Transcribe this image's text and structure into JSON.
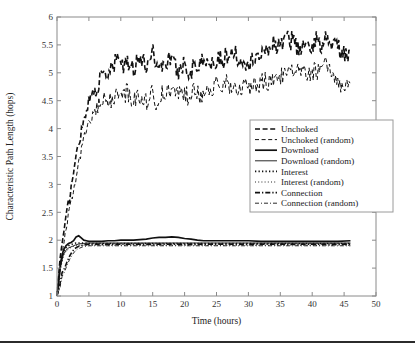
{
  "figure": {
    "background": "#ffffff",
    "ink": "#111111",
    "axis_color": "#8a8a8a",
    "footer_rule_y": 341
  },
  "chart_data": {
    "type": "line",
    "title": "",
    "xlabel": "Time (hours)",
    "ylabel": "Characteristic Path Length (hops)",
    "xlim": [
      0,
      50
    ],
    "ylim": [
      1,
      6
    ],
    "xticks": [
      0,
      5,
      10,
      15,
      20,
      25,
      30,
      35,
      40,
      45,
      50
    ],
    "xticklabels": [
      "0",
      "5",
      "10",
      "15",
      "20",
      "25",
      "30",
      "35",
      "40",
      "45",
      "50"
    ],
    "yticks": [
      1,
      1.5,
      2,
      2.5,
      3,
      3.5,
      4,
      4.5,
      5,
      5.5,
      6
    ],
    "yticklabels": [
      "1",
      "1.5",
      "2",
      "2.5",
      "3",
      "3.5",
      "4",
      "4.5",
      "5",
      "5.5",
      "6"
    ],
    "grid": false,
    "legend_position": "center-right",
    "series": [
      {
        "name": "Unchoked",
        "style": "dashed",
        "width": 1.6,
        "x": [
          0,
          0.5,
          1,
          1.5,
          2,
          2.5,
          3,
          3.5,
          4,
          4.5,
          5,
          5.5,
          6,
          6.5,
          7,
          7.5,
          8,
          8.5,
          9,
          9.5,
          10,
          10.5,
          11,
          11.5,
          12,
          12.5,
          13,
          13.5,
          14,
          14.5,
          15,
          15.5,
          16,
          16.5,
          17,
          17.5,
          18,
          18.5,
          19,
          19.5,
          20,
          20.5,
          21,
          21.5,
          22,
          22.5,
          23,
          23.5,
          24,
          24.5,
          25,
          25.5,
          26,
          26.5,
          27,
          27.5,
          28,
          28.5,
          29,
          29.5,
          30,
          30.5,
          31,
          31.5,
          32,
          32.5,
          33,
          33.5,
          34,
          34.5,
          35,
          35.5,
          36,
          36.5,
          37,
          37.5,
          38,
          38.5,
          39,
          39.5,
          40,
          40.5,
          41,
          41.5,
          42,
          42.5,
          43,
          43.5,
          44,
          44.5,
          45,
          45.5,
          46
        ],
        "y": [
          1.0,
          1.7,
          2.1,
          2.45,
          2.8,
          3.15,
          3.5,
          3.8,
          4.05,
          4.3,
          4.5,
          4.62,
          4.72,
          4.8,
          4.9,
          5.0,
          4.95,
          5.05,
          5.12,
          5.35,
          5.18,
          5.08,
          5.16,
          5.24,
          5.05,
          5.22,
          5.3,
          5.18,
          5.12,
          5.28,
          5.45,
          5.15,
          5.2,
          5.08,
          5.15,
          5.3,
          5.22,
          5.12,
          5.02,
          5.1,
          5.2,
          5.08,
          5.0,
          5.18,
          5.1,
          5.22,
          5.15,
          5.28,
          5.18,
          5.12,
          5.25,
          5.32,
          5.18,
          5.3,
          5.38,
          5.28,
          5.42,
          5.2,
          5.3,
          5.22,
          5.15,
          5.28,
          5.2,
          5.35,
          5.28,
          5.4,
          5.5,
          5.42,
          5.55,
          5.48,
          5.6,
          5.52,
          5.68,
          5.55,
          5.62,
          5.48,
          5.4,
          5.52,
          5.45,
          5.38,
          5.5,
          5.62,
          5.55,
          5.48,
          5.6,
          5.7,
          5.58,
          5.45,
          5.5,
          5.4,
          5.35,
          5.28,
          5.35
        ]
      },
      {
        "name": "Unchoked (random)",
        "style": "dashed",
        "width": 1.0,
        "x": [
          0,
          0.5,
          1,
          1.5,
          2,
          2.5,
          3,
          3.5,
          4,
          4.5,
          5,
          5.5,
          6,
          6.5,
          7,
          7.5,
          8,
          8.5,
          9,
          9.5,
          10,
          10.5,
          11,
          11.5,
          12,
          12.5,
          13,
          13.5,
          14,
          14.5,
          15,
          15.5,
          16,
          16.5,
          17,
          17.5,
          18,
          18.5,
          19,
          19.5,
          20,
          20.5,
          21,
          21.5,
          22,
          22.5,
          23,
          23.5,
          24,
          24.5,
          25,
          25.5,
          26,
          26.5,
          27,
          27.5,
          28,
          28.5,
          29,
          29.5,
          30,
          30.5,
          31,
          31.5,
          32,
          32.5,
          33,
          33.5,
          34,
          34.5,
          35,
          35.5,
          36,
          36.5,
          37,
          37.5,
          38,
          38.5,
          39,
          39.5,
          40,
          40.5,
          41,
          41.5,
          42,
          42.5,
          43,
          43.5,
          44,
          44.5,
          45,
          45.5,
          46
        ],
        "y": [
          1.0,
          1.5,
          1.9,
          2.2,
          2.55,
          2.85,
          3.15,
          3.45,
          3.7,
          3.95,
          4.1,
          4.22,
          4.3,
          4.38,
          4.45,
          4.5,
          4.46,
          4.52,
          4.58,
          4.62,
          4.55,
          4.6,
          4.66,
          4.58,
          4.5,
          4.55,
          4.62,
          4.54,
          4.48,
          4.56,
          4.62,
          4.5,
          4.55,
          4.62,
          4.58,
          4.66,
          4.6,
          4.68,
          4.62,
          4.7,
          4.64,
          4.58,
          4.66,
          4.72,
          4.64,
          4.6,
          4.68,
          4.74,
          4.66,
          4.72,
          4.78,
          4.7,
          4.76,
          4.82,
          4.74,
          4.8,
          4.72,
          4.78,
          4.7,
          4.76,
          4.68,
          4.75,
          4.82,
          4.74,
          4.8,
          4.88,
          4.8,
          4.86,
          4.94,
          4.86,
          4.92,
          5.0,
          4.92,
          4.98,
          5.06,
          4.98,
          5.04,
          4.96,
          5.02,
          4.94,
          5.0,
          5.08,
          5.0,
          5.06,
          5.14,
          5.06,
          5.0,
          4.92,
          4.85,
          4.78,
          4.82,
          4.76,
          4.8
        ]
      },
      {
        "name": "Download",
        "style": "solid",
        "width": 1.7,
        "x": [
          0,
          0.3,
          0.6,
          1,
          1.4,
          1.8,
          2.2,
          2.6,
          3,
          3.4,
          3.8,
          4.2,
          4.6,
          5,
          6,
          7,
          8,
          9,
          10,
          11,
          12,
          13,
          14,
          15,
          16,
          17,
          18,
          19,
          20,
          21,
          22,
          23,
          24,
          25,
          26,
          27,
          28,
          30,
          32,
          34,
          36,
          38,
          40,
          42,
          44,
          46
        ],
        "y": [
          1.0,
          1.35,
          1.62,
          1.82,
          1.9,
          1.94,
          1.96,
          1.99,
          2.06,
          2.08,
          2.04,
          2.0,
          1.99,
          1.98,
          1.98,
          1.98,
          1.99,
          1.99,
          2.0,
          2.0,
          2.0,
          2.01,
          2.02,
          2.04,
          2.05,
          2.05,
          2.06,
          2.05,
          2.03,
          2.02,
          2.0,
          1.99,
          1.99,
          1.99,
          1.99,
          1.99,
          1.99,
          1.99,
          1.98,
          1.98,
          1.98,
          1.98,
          1.98,
          1.98,
          1.98,
          1.99
        ]
      },
      {
        "name": "Download (random)",
        "style": "solid",
        "width": 0.9,
        "x": [
          0,
          0.3,
          0.6,
          1,
          1.4,
          1.8,
          2.2,
          2.6,
          3,
          3.4,
          3.8,
          4.2,
          4.6,
          5,
          6,
          7,
          8,
          9,
          10,
          12,
          14,
          16,
          18,
          20,
          22,
          24,
          26,
          28,
          30,
          32,
          34,
          36,
          38,
          40,
          42,
          44,
          46
        ],
        "y": [
          1.0,
          1.28,
          1.55,
          1.74,
          1.82,
          1.86,
          1.88,
          1.9,
          1.92,
          1.93,
          1.94,
          1.94,
          1.95,
          1.95,
          1.95,
          1.95,
          1.95,
          1.95,
          1.95,
          1.95,
          1.95,
          1.95,
          1.95,
          1.95,
          1.95,
          1.95,
          1.95,
          1.95,
          1.95,
          1.95,
          1.95,
          1.95,
          1.95,
          1.95,
          1.95,
          1.95,
          1.95
        ]
      },
      {
        "name": "Interest",
        "style": "dotted",
        "width": 1.6,
        "x": [
          0,
          0.3,
          0.6,
          1,
          1.4,
          1.8,
          2.2,
          2.6,
          3,
          3.5,
          4,
          5,
          6,
          8,
          10,
          12,
          14,
          16,
          18,
          20,
          22,
          24,
          26,
          28,
          30,
          32,
          34,
          36,
          38,
          40,
          42,
          44,
          46
        ],
        "y": [
          1.0,
          1.3,
          1.58,
          1.78,
          1.86,
          1.9,
          1.92,
          1.94,
          1.95,
          1.95,
          1.95,
          1.94,
          1.94,
          1.94,
          1.94,
          1.94,
          1.94,
          1.94,
          1.94,
          1.94,
          1.94,
          1.94,
          1.94,
          1.94,
          1.94,
          1.94,
          1.94,
          1.94,
          1.94,
          1.94,
          1.94,
          1.94,
          1.94
        ]
      },
      {
        "name": "Interest (random)",
        "style": "dotted",
        "width": 0.9,
        "x": [
          0,
          0.3,
          0.6,
          1,
          1.4,
          1.8,
          2.2,
          2.6,
          3,
          3.5,
          4,
          5,
          6,
          8,
          10,
          12,
          14,
          16,
          18,
          20,
          22,
          24,
          26,
          28,
          30,
          32,
          34,
          36,
          38,
          40,
          42,
          44,
          46
        ],
        "y": [
          1.0,
          1.25,
          1.52,
          1.72,
          1.8,
          1.84,
          1.87,
          1.89,
          1.9,
          1.91,
          1.91,
          1.91,
          1.91,
          1.91,
          1.91,
          1.91,
          1.91,
          1.91,
          1.91,
          1.91,
          1.91,
          1.91,
          1.91,
          1.91,
          1.91,
          1.91,
          1.91,
          1.91,
          1.91,
          1.91,
          1.91,
          1.91,
          1.91
        ]
      },
      {
        "name": "Connection",
        "style": "dashdot",
        "width": 1.6,
        "x": [
          0,
          0.4,
          0.8,
          1.2,
          1.6,
          2,
          2.4,
          2.8,
          3.2,
          3.6,
          4,
          4.5,
          5,
          6,
          8,
          10,
          12,
          14,
          16,
          18,
          20,
          22,
          24,
          26,
          28,
          30,
          32,
          34,
          36,
          38,
          40,
          42,
          44,
          46
        ],
        "y": [
          1.0,
          1.18,
          1.42,
          1.5,
          1.62,
          1.72,
          1.8,
          1.85,
          1.88,
          1.9,
          1.91,
          1.92,
          1.93,
          1.93,
          1.93,
          1.93,
          1.93,
          1.93,
          1.93,
          1.93,
          1.93,
          1.93,
          1.93,
          1.93,
          1.93,
          1.93,
          1.93,
          1.93,
          1.93,
          1.93,
          1.93,
          1.93,
          1.93,
          1.93
        ]
      },
      {
        "name": "Connection (random)",
        "style": "dashdot",
        "width": 0.9,
        "x": [
          0,
          0.4,
          0.8,
          1.2,
          1.6,
          2,
          2.4,
          2.8,
          3.2,
          3.6,
          4,
          4.5,
          5,
          6,
          8,
          10,
          12,
          14,
          16,
          18,
          20,
          22,
          24,
          26,
          28,
          30,
          32,
          34,
          36,
          38,
          40,
          42,
          44,
          46
        ],
        "y": [
          1.0,
          1.12,
          1.35,
          1.44,
          1.56,
          1.66,
          1.74,
          1.8,
          1.84,
          1.86,
          1.88,
          1.89,
          1.9,
          1.9,
          1.9,
          1.9,
          1.9,
          1.9,
          1.9,
          1.9,
          1.9,
          1.9,
          1.9,
          1.9,
          1.9,
          1.9,
          1.9,
          1.9,
          1.9,
          1.9,
          1.9,
          1.9,
          1.9,
          1.9
        ]
      }
    ]
  },
  "legend": {
    "items": [
      {
        "label": "Unchoked"
      },
      {
        "label": "Unchoked (random)"
      },
      {
        "label": "Download"
      },
      {
        "label": "Download (random)"
      },
      {
        "label": "Interest"
      },
      {
        "label": "Interest (random)"
      },
      {
        "label": "Connection"
      },
      {
        "label": "Connection (random)"
      }
    ]
  }
}
